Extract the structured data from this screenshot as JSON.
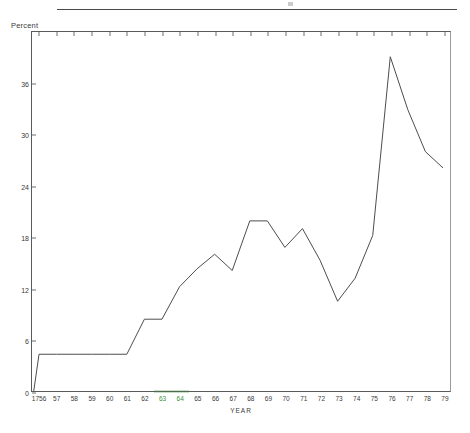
{
  "figure": {
    "y_axis_title": "Percent",
    "x_axis_title": "YEAR",
    "highlight_color": "#3a8f3a",
    "line_color": "#4d4d4d"
  },
  "chart_data": {
    "type": "line",
    "title": "",
    "subtitle": "",
    "xlabel": "YEAR",
    "ylabel": "Percent",
    "xlim": [
      1955.6,
      1979.4
    ],
    "ylim": [
      0,
      42
    ],
    "yticks": [
      0,
      6,
      12,
      18,
      24,
      30,
      36
    ],
    "ytick_labels": [
      "0",
      "6",
      "12",
      "18",
      "24",
      "30",
      "36"
    ],
    "xticks": [
      1956,
      1957,
      1958,
      1959,
      1960,
      1961,
      1962,
      1963,
      1964,
      1965,
      1966,
      1967,
      1968,
      1969,
      1970,
      1971,
      1972,
      1973,
      1974,
      1975,
      1976,
      1977,
      1978,
      1979
    ],
    "xtick_labels": [
      "1756",
      "57",
      "58",
      "59",
      "60",
      "61",
      "62",
      "63",
      "64",
      "65",
      "66",
      "67",
      "68",
      "69",
      "70",
      "71",
      "72",
      "73",
      "74",
      "75",
      "76",
      "77",
      "78",
      "79"
    ],
    "highlighted_xtick_labels": [
      "63",
      "64"
    ],
    "grid": false,
    "legend": false,
    "x": [
      1955.7,
      1956,
      1957,
      1958,
      1959,
      1960,
      1961,
      1962,
      1963,
      1964,
      1965,
      1966,
      1967,
      1968,
      1969,
      1970,
      1971,
      1972,
      1973,
      1974,
      1975,
      1976,
      1977,
      1978,
      1979
    ],
    "values": [
      0.0,
      4.3,
      4.3,
      4.3,
      4.3,
      4.3,
      4.3,
      8.4,
      8.4,
      12.2,
      14.3,
      16.0,
      14.1,
      19.9,
      19.9,
      16.8,
      19.0,
      15.3,
      10.5,
      13.2,
      18.2,
      39.1,
      32.9,
      28.0,
      26.1
    ]
  }
}
